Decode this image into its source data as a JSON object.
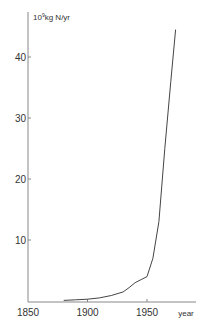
{
  "chart_data": {
    "type": "line",
    "title": "",
    "ylabel": "10⁹kg N/yr",
    "xlabel": "year",
    "xlim": [
      1850,
      1990
    ],
    "ylim": [
      0,
      45
    ],
    "grid": false,
    "legend": null,
    "x_ticks": [
      1850,
      1900,
      1950
    ],
    "y_ticks": [
      10,
      20,
      30,
      40
    ],
    "series": [
      {
        "name": "nitrogen",
        "x": [
          1880,
          1890,
          1900,
          1910,
          1920,
          1930,
          1935,
          1940,
          1945,
          1950,
          1955,
          1960,
          1965,
          1970,
          1974
        ],
        "values": [
          0.1,
          0.2,
          0.3,
          0.5,
          0.9,
          1.5,
          2.2,
          3.0,
          3.5,
          4.0,
          7.0,
          13.0,
          25.0,
          36.0,
          44.5
        ]
      }
    ]
  },
  "labels": {
    "y_unit_base": "10",
    "y_unit_exp": "9",
    "y_unit_rest": "kg N/yr",
    "x_unit": "year",
    "x_ticks": [
      "1850",
      "1900",
      "1950"
    ],
    "y_ticks": [
      "10",
      "20",
      "30",
      "40"
    ]
  }
}
